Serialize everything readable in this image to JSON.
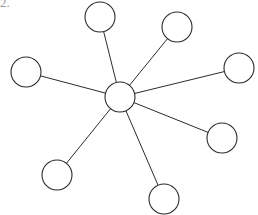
{
  "figure": {
    "label": "2.",
    "background_color": "#ffffff",
    "stroke_color": "#2b2b2b",
    "node_fill_color": "#ffffff",
    "label_color": "#9a9a9a",
    "width": 258,
    "height": 215
  },
  "graph": {
    "type": "star",
    "node_count": 9,
    "edge_count": 8,
    "hub": {
      "id": "hub",
      "name": "center-node",
      "cx": 120,
      "cy": 97,
      "r": 15
    },
    "leaves": [
      {
        "id": "n1",
        "name": "node-top",
        "cx": 100,
        "cy": 17,
        "r": 15
      },
      {
        "id": "n2",
        "name": "node-top-right",
        "cx": 177,
        "cy": 27,
        "r": 15
      },
      {
        "id": "n3",
        "name": "node-right",
        "cx": 239,
        "cy": 68,
        "r": 15
      },
      {
        "id": "n4",
        "name": "node-lower-right",
        "cx": 222,
        "cy": 138,
        "r": 15
      },
      {
        "id": "n5",
        "name": "node-bottom",
        "cx": 164,
        "cy": 199,
        "r": 15
      },
      {
        "id": "n6",
        "name": "node-lower-left",
        "cx": 57,
        "cy": 175,
        "r": 15
      },
      {
        "id": "n7",
        "name": "node-left",
        "cx": 26,
        "cy": 72,
        "r": 15
      }
    ],
    "edges": [
      {
        "id": "e1",
        "from": "hub",
        "to": "n1"
      },
      {
        "id": "e2",
        "from": "hub",
        "to": "n2"
      },
      {
        "id": "e3",
        "from": "hub",
        "to": "n3"
      },
      {
        "id": "e4",
        "from": "hub",
        "to": "n4"
      },
      {
        "id": "e5",
        "from": "hub",
        "to": "n5"
      },
      {
        "id": "e6",
        "from": "hub",
        "to": "n6"
      },
      {
        "id": "e7",
        "from": "hub",
        "to": "n7"
      }
    ]
  }
}
